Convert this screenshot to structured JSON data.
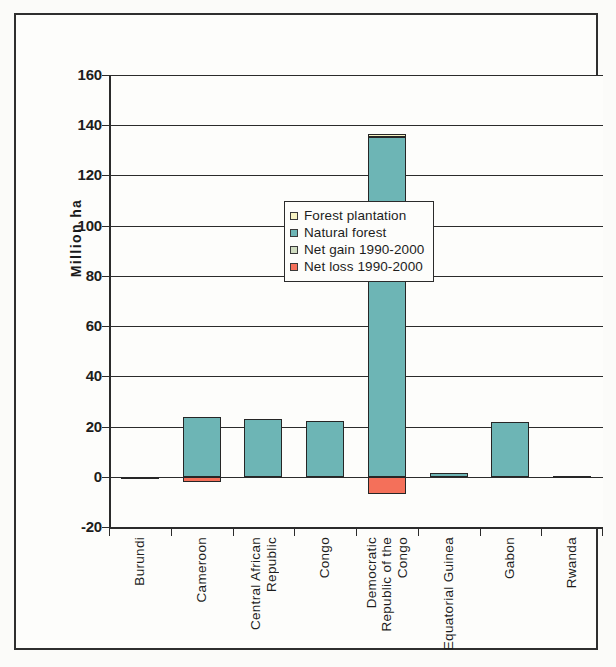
{
  "chart_data": {
    "type": "bar",
    "title": "",
    "subtitle": "",
    "xlabel": "",
    "ylabel": "Million ha",
    "ylim": [
      -20,
      160
    ],
    "yticks": [
      -20,
      0,
      20,
      40,
      60,
      80,
      100,
      120,
      140,
      160
    ],
    "ytick_labels": [
      "-20",
      "0",
      "20",
      "40",
      "60",
      "80",
      "100",
      "120",
      "140",
      "160"
    ],
    "grid": true,
    "stacked": true,
    "legend_position": "inside-upper-left",
    "categories": [
      "Burundi",
      "Cameroon",
      "Central African Republic",
      "Congo",
      "Democratic Republic of the Congo",
      "Equatorial Guinea",
      "Gabon",
      "Rwanda"
    ],
    "category_lines": [
      [
        "Burundi"
      ],
      [
        "Cameroon"
      ],
      [
        "Central African",
        "Republic"
      ],
      [
        "Congo"
      ],
      [
        "Democratic",
        "Republic of the",
        "Congo"
      ],
      [
        "Equatorial Guinea"
      ],
      [
        "Gabon"
      ],
      [
        "Rwanda"
      ]
    ],
    "series": [
      {
        "name": "Natural forest",
        "color": "#6db5b5",
        "values": [
          0.1,
          23.9,
          22.9,
          22.1,
          135.2,
          1.7,
          21.8,
          0.3
        ]
      },
      {
        "name": "Forest plantation",
        "color": "#f7f3c3",
        "values": [
          0,
          0,
          0,
          0,
          1.5,
          0,
          0,
          0
        ]
      },
      {
        "name": "Net gain 1990-2000",
        "color": "#cfdcc0",
        "values": [
          0,
          0,
          0,
          0,
          0,
          0,
          0,
          0
        ]
      },
      {
        "name": "Net loss 1990-2000",
        "color": "#f4705a",
        "values": [
          0,
          -2.2,
          0,
          0,
          -7.0,
          0,
          0,
          0
        ]
      }
    ]
  },
  "legend": {
    "items": [
      {
        "label": "Forest plantation",
        "color": "#f7f3c3"
      },
      {
        "label": "Natural forest",
        "color": "#6db5b5"
      },
      {
        "label": "Net gain 1990-2000",
        "color": "#cfdcc0"
      },
      {
        "label": "Net loss 1990-2000",
        "color": "#f4705a"
      }
    ]
  },
  "axis": {
    "y_title": "Million ha"
  }
}
